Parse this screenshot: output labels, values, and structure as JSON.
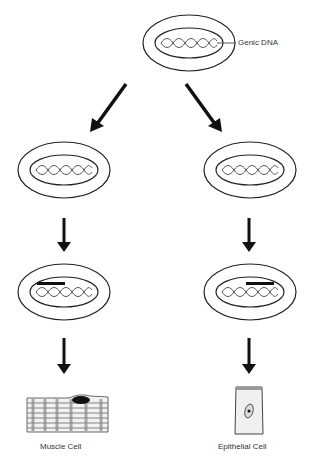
{
  "diagram": {
    "top_cell": {
      "label": "Genic DNA"
    },
    "left_branch": {
      "final_label": "Muscle Cell"
    },
    "right_branch": {
      "final_label": "Epithelial Cell"
    }
  }
}
